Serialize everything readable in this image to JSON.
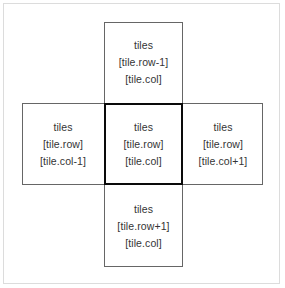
{
  "diagram": {
    "colors": {
      "background": "#ffffff",
      "outer_frame_border": "#dcdcdc",
      "cell_border": "#666666",
      "center_border": "#0a0a0a",
      "text": "#343434"
    },
    "cells": {
      "top": {
        "position": "top",
        "line1": "tiles",
        "line2": "[tile.row-1]",
        "line3": "[tile.col]"
      },
      "left": {
        "position": "left",
        "line1": "tiles",
        "line2": "[tile.row]",
        "line3": "[tile.col-1]"
      },
      "center": {
        "position": "center",
        "line1": "tiles",
        "line2": "[tile.row]",
        "line3": "[tile.col]"
      },
      "right": {
        "position": "right",
        "line1": "tiles",
        "line2": "[tile.row]",
        "line3": "[tile.col+1]"
      },
      "bottom": {
        "position": "bottom",
        "line1": "tiles",
        "line2": "[tile.row+1]",
        "line3": "[tile.col]"
      }
    }
  }
}
